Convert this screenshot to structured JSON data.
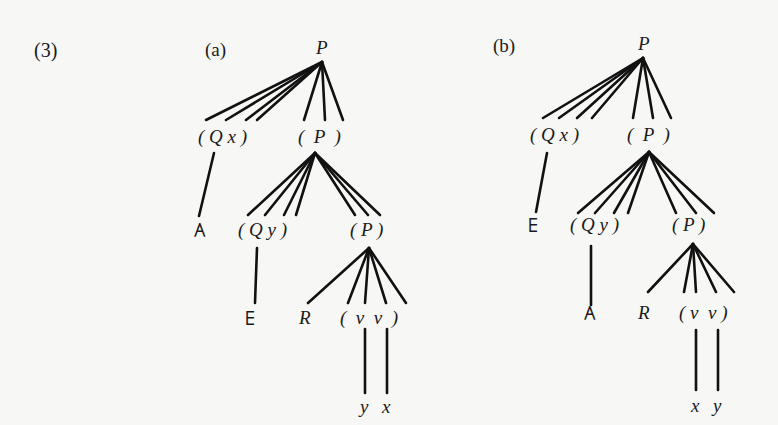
{
  "example_number": "(3)",
  "trees": [
    {
      "label": "(a)",
      "root": "P",
      "level1": {
        "quantifier_phrase": "( Q x )",
        "sentence": "(  P  )"
      },
      "level1_quantifier_child": "∃",
      "level2": {
        "quantifier_phrase": "( Q y )",
        "sentence": "( P )"
      },
      "level2_quantifier_child": "∀",
      "level3": {
        "predicate": "R",
        "args": "(  ν  ν  )"
      },
      "level4": {
        "var1": "y",
        "var2": "x"
      }
    },
    {
      "label": "(b)",
      "root": "P",
      "level1": {
        "quantifier_phrase": "( Q x )",
        "sentence": "(  P  )"
      },
      "level1_quantifier_child": "∀",
      "level2": {
        "quantifier_phrase": "( Q y )",
        "sentence": "( P )"
      },
      "level2_quantifier_child": "∃",
      "level3": {
        "predicate": "R",
        "args": "( ν  ν )"
      },
      "level4": {
        "var1": "x",
        "var2": "y"
      }
    }
  ],
  "symbols": {
    "exists": "∃",
    "forall": "∀",
    "variable_marker": "ν"
  }
}
